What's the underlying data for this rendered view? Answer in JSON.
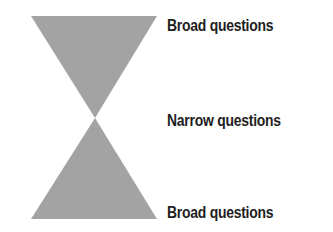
{
  "diagram": {
    "type": "hourglass",
    "fill_color": "#a3a3a3",
    "labels": {
      "top": "Broad questions",
      "middle": "Narrow questions",
      "bottom": "Broad questions"
    }
  }
}
